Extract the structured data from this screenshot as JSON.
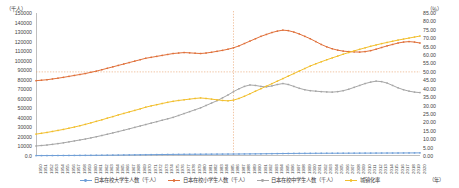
{
  "axes": {
    "left_unit": "（千人）",
    "right_unit": "（％）",
    "x_unit": "（年）",
    "y_left_ticks": [
      "150000",
      "140000",
      "130000",
      "120000",
      "110000",
      "100000",
      "90000",
      "80000",
      "70000",
      "60000",
      "50000",
      "40000",
      "30000",
      "20000",
      "10000",
      "0.0"
    ],
    "y_right_ticks": [
      "85.00",
      "80.00",
      "75.00",
      "70.00",
      "65.00",
      "60.00",
      "55.00",
      "50.00",
      "45.00",
      "40.00",
      "35.00",
      "30.00",
      "25.00",
      "20.00",
      "15.00",
      "10.00",
      "5.00",
      "0.00"
    ]
  },
  "legend": [
    {
      "label": "日本在校大学生人数（千人）",
      "color": "#6f9fd8"
    },
    {
      "label": "日本在校小学生人数（千人）",
      "color": "#e0703a"
    },
    {
      "label": "日本在校中学生人数（千人）",
      "color": "#a6a6a6"
    },
    {
      "label": "城镇化率",
      "color": "#f2bf2e"
    }
  ],
  "chart_data": {
    "type": "line",
    "title": "",
    "xlabel": "（年）",
    "ylabel": "（千人）",
    "ylabel_right": "（％）",
    "grid": false,
    "legend_position": "bottom",
    "ylim": [
      0,
      150000
    ],
    "ylim_right": [
      0,
      85
    ],
    "x": [
      1950,
      1951,
      1952,
      1953,
      1954,
      1955,
      1956,
      1957,
      1958,
      1959,
      1960,
      1961,
      1962,
      1963,
      1964,
      1965,
      1966,
      1967,
      1968,
      1969,
      1970,
      1971,
      1972,
      1973,
      1974,
      1975,
      1976,
      1977,
      1978,
      1979,
      1980,
      1981,
      1982,
      1983,
      1984,
      1985,
      1986,
      1987,
      1988,
      1989,
      1990,
      1991,
      1992,
      1993,
      1994,
      1995,
      1996,
      1997,
      1998,
      1999,
      2000,
      2001,
      2002,
      2003,
      2004,
      2005,
      2006,
      2007,
      2008,
      2009,
      2010,
      2011,
      2012,
      2013,
      2014,
      2015,
      2016,
      2017,
      2018,
      2019,
      2020
    ],
    "reference_lines": {
      "vertical_x": 1986,
      "horizontal_right_value": 50.0,
      "horizontal_color": "#e8a06a",
      "vertical_color": "#e8a06a"
    },
    "series": [
      {
        "name": "日本在校大学生人数（千人）",
        "color": "#6f9fd8",
        "axis": "left",
        "values": [
          390,
          420,
          450,
          480,
          510,
          540,
          570,
          600,
          640,
          680,
          710,
          760,
          810,
          870,
          930,
          1000,
          1070,
          1140,
          1210,
          1280,
          1350,
          1420,
          1480,
          1540,
          1600,
          1660,
          1710,
          1760,
          1800,
          1840,
          1870,
          1900,
          1930,
          1960,
          1990,
          2020,
          2060,
          2100,
          2150,
          2200,
          2250,
          2310,
          2380,
          2450,
          2520,
          2590,
          2650,
          2700,
          2740,
          2770,
          2800,
          2830,
          2860,
          2880,
          2900,
          2920,
          2940,
          2960,
          2980,
          3000,
          3020,
          3040,
          3060,
          3080,
          3100,
          3120,
          3150,
          3180,
          3210,
          3240,
          3270
        ]
      },
      {
        "name": "日本在校小学生人数（千人）",
        "color": "#e0703a",
        "axis": "left",
        "values": [
          79000,
          79500,
          80000,
          80800,
          81600,
          82500,
          83500,
          84500,
          85500,
          86500,
          87800,
          89000,
          90500,
          92000,
          93500,
          95000,
          96500,
          98000,
          99500,
          101000,
          102500,
          103500,
          104500,
          105500,
          106500,
          107500,
          108000,
          108500,
          108200,
          107800,
          107500,
          108000,
          108800,
          109800,
          110800,
          112000,
          113500,
          115500,
          118000,
          120500,
          123000,
          125500,
          127500,
          129500,
          131000,
          132000,
          131500,
          130000,
          128000,
          125500,
          123000,
          120000,
          117000,
          114500,
          112500,
          111000,
          110000,
          109500,
          109200,
          109000,
          109500,
          110500,
          112000,
          113800,
          115500,
          117000,
          118500,
          119500,
          120000,
          119500,
          118500
        ]
      },
      {
        "name": "日本在校中学生人数（千人）",
        "color": "#a6a6a6",
        "axis": "left",
        "values": [
          10500,
          11000,
          11500,
          12200,
          13000,
          13800,
          14800,
          15800,
          16800,
          17800,
          19000,
          20200,
          21500,
          22800,
          24200,
          25600,
          27000,
          28500,
          30000,
          31500,
          33000,
          34500,
          36000,
          37500,
          39000,
          40500,
          42500,
          44500,
          46500,
          48500,
          50500,
          53000,
          55500,
          58000,
          61000,
          64000,
          67500,
          70500,
          73000,
          74500,
          74000,
          73000,
          72500,
          73500,
          75000,
          76000,
          75000,
          73000,
          71000,
          69500,
          68500,
          68000,
          67500,
          67200,
          67000,
          67500,
          68500,
          70000,
          72000,
          74000,
          76000,
          77500,
          78500,
          78000,
          76500,
          74000,
          71500,
          69500,
          68000,
          67000,
          66500
        ]
      },
      {
        "name": "城镇化率",
        "color": "#f2bf2e",
        "axis": "right",
        "values": [
          13.0,
          13.5,
          14.0,
          14.6,
          15.2,
          15.8,
          16.5,
          17.2,
          18.0,
          18.8,
          19.7,
          20.6,
          21.5,
          22.5,
          23.4,
          24.4,
          25.3,
          26.2,
          27.1,
          28.0,
          29.0,
          29.8,
          30.5,
          31.2,
          31.9,
          32.5,
          33.0,
          33.4,
          33.8,
          34.2,
          34.5,
          34.2,
          33.8,
          33.4,
          33.0,
          32.8,
          33.2,
          34.2,
          35.5,
          37.0,
          38.5,
          40.0,
          41.5,
          43.0,
          44.5,
          46.0,
          47.5,
          49.0,
          50.5,
          52.0,
          53.5,
          54.8,
          56.0,
          57.2,
          58.3,
          59.4,
          60.5,
          61.5,
          62.5,
          63.4,
          64.3,
          65.2,
          66.0,
          66.8,
          67.5,
          68.2,
          68.9,
          69.5,
          70.1,
          70.7,
          71.3
        ]
      }
    ]
  }
}
